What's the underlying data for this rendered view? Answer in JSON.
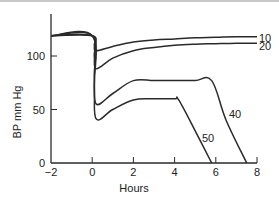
{
  "chart_data": {
    "type": "line",
    "title": "",
    "xlabel": "Hours",
    "ylabel": "BP mm Hg",
    "xlim": [
      -2,
      8
    ],
    "ylim": [
      0,
      130
    ],
    "x_ticks": [
      -2,
      0,
      2,
      4,
      6,
      8
    ],
    "x_tick_labels": [
      "−2",
      "0",
      "2",
      "4",
      "6",
      "8"
    ],
    "y_ticks": [
      0,
      50,
      100
    ],
    "y_tick_labels": [
      "0",
      "50",
      "100"
    ],
    "grid": false,
    "legend": "inline labels at line ends",
    "series": [
      {
        "name": "10",
        "label_position": "right-end",
        "x": [
          -2,
          0,
          0.1,
          0.2,
          1,
          2,
          3,
          4,
          5,
          6,
          7,
          8
        ],
        "values": [
          119,
          119,
          110,
          105,
          109,
          113,
          115,
          116,
          117,
          117.5,
          118,
          118
        ]
      },
      {
        "name": "20",
        "label_position": "right-end",
        "x": [
          -2,
          0,
          0.1,
          0.2,
          1,
          2,
          3,
          4,
          5,
          6,
          7,
          8
        ],
        "values": [
          119,
          119,
          100,
          88,
          98,
          105,
          108,
          110,
          111,
          111.5,
          112,
          112
        ]
      },
      {
        "name": "40",
        "label_position": "on descending segment",
        "x": [
          -2,
          0,
          0.1,
          0.2,
          1,
          2,
          3,
          4,
          5,
          5.8,
          6.5,
          7.5
        ],
        "values": [
          119,
          119,
          80,
          55,
          65,
          77,
          77,
          77,
          77,
          77,
          40,
          0
        ]
      },
      {
        "name": "50",
        "label_position": "on descending segment",
        "x": [
          -2,
          0,
          0.1,
          0.2,
          1,
          2,
          3,
          4,
          4.2,
          5,
          5.8
        ],
        "values": [
          119,
          119,
          70,
          41,
          50,
          59,
          60,
          60,
          59,
          30,
          0
        ]
      }
    ]
  },
  "labels": {
    "xlabel": "Hours",
    "ylabel": "BP mm Hg",
    "series_10": "10",
    "series_20": "20",
    "series_40": "40",
    "series_50": "50",
    "x_ticks": [
      "−2",
      "0",
      "2",
      "4",
      "6",
      "8"
    ],
    "y_ticks": [
      "0",
      "50",
      "100"
    ]
  },
  "colors": {
    "line": "#2a2a2a",
    "axis": "#2a2a2a",
    "background": "#ffffff"
  }
}
